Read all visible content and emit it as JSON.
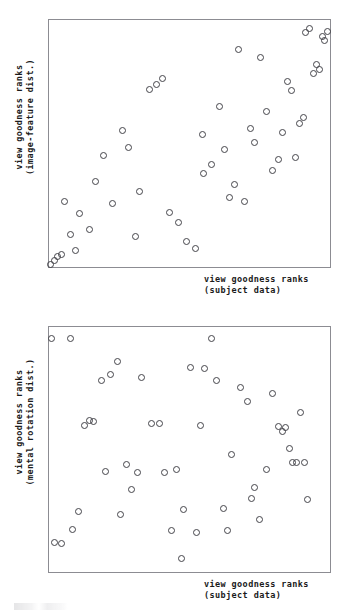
{
  "figure": {
    "background_color": "#ffffff",
    "frame_color": "#8c8c92",
    "marker_color": "#44444a",
    "text_color": "#1b1b1b"
  },
  "panels": [
    {
      "id": "top",
      "xlabel_line1": "view goodness ranks",
      "xlabel_line2": "(subject data)",
      "ylabel_line1": "view goodness ranks",
      "ylabel_line2": "(image-feature dist.)"
    },
    {
      "id": "bottom",
      "xlabel_line1": "view goodness ranks",
      "xlabel_line2": "(subject data)",
      "ylabel_line1": "view goodness ranks",
      "ylabel_line2": "(mental rotation dist.)"
    }
  ],
  "chart_data": [
    {
      "type": "scatter",
      "title": "",
      "xlabel": "view goodness ranks (subject data)",
      "ylabel": "view goodness ranks (image-feature dist.)",
      "xlim": [
        0,
        100
      ],
      "ylim": [
        0,
        100
      ],
      "grid": false,
      "legend": "none",
      "marker": "open-circle",
      "n_points": 52,
      "points": [
        [
          0.7,
          1.2
        ],
        [
          2.1,
          2.6
        ],
        [
          3.2,
          4.1
        ],
        [
          4.6,
          5.0
        ],
        [
          7.5,
          13.0
        ],
        [
          9.3,
          6.8
        ],
        [
          5.6,
          26.5
        ],
        [
          10.9,
          21.5
        ],
        [
          14.3,
          15.0
        ],
        [
          16.7,
          34.5
        ],
        [
          19.3,
          45.0
        ],
        [
          22.6,
          25.8
        ],
        [
          26.0,
          55.3
        ],
        [
          28.2,
          48.2
        ],
        [
          30.9,
          12.5
        ],
        [
          32.2,
          30.5
        ],
        [
          35.6,
          72.0
        ],
        [
          38.1,
          74.0
        ],
        [
          40.5,
          76.5
        ],
        [
          43.0,
          22.0
        ],
        [
          46.2,
          18.0
        ],
        [
          49.0,
          10.5
        ],
        [
          52.0,
          7.5
        ],
        [
          54.5,
          53.5
        ],
        [
          55.0,
          38.0
        ],
        [
          57.9,
          41.5
        ],
        [
          60.5,
          65.0
        ],
        [
          62.4,
          47.5
        ],
        [
          64.1,
          28.0
        ],
        [
          66.0,
          33.5
        ],
        [
          67.5,
          88.0
        ],
        [
          69.4,
          26.5
        ],
        [
          71.8,
          56.0
        ],
        [
          73.0,
          50.3
        ],
        [
          75.1,
          85.0
        ],
        [
          77.3,
          62.8
        ],
        [
          79.5,
          39.0
        ],
        [
          81.6,
          43.5
        ],
        [
          83.1,
          54.5
        ],
        [
          84.9,
          75.0
        ],
        [
          86.2,
          71.5
        ],
        [
          87.8,
          44.5
        ],
        [
          89.0,
          58.0
        ],
        [
          90.5,
          60.5
        ],
        [
          91.2,
          95.0
        ],
        [
          92.6,
          96.5
        ],
        [
          94.0,
          78.5
        ],
        [
          95.1,
          82.0
        ],
        [
          96.3,
          80.0
        ],
        [
          97.2,
          93.5
        ],
        [
          98.1,
          91.5
        ],
        [
          99.2,
          95.5
        ]
      ]
    },
    {
      "type": "scatter",
      "title": "",
      "xlabel": "view goodness ranks (subject data)",
      "ylabel": "view goodness ranks (mental rotation dist.)",
      "xlim": [
        0,
        100
      ],
      "ylim": [
        0,
        100
      ],
      "grid": false,
      "legend": "none",
      "marker": "open-circle",
      "n_points": 50,
      "points": [
        [
          0.8,
          95.5
        ],
        [
          7.6,
          95.5
        ],
        [
          1.9,
          12.0
        ],
        [
          4.5,
          11.5
        ],
        [
          10.5,
          24.5
        ],
        [
          16.0,
          61.5
        ],
        [
          18.6,
          78.0
        ],
        [
          22.0,
          80.5
        ],
        [
          24.2,
          86.0
        ],
        [
          25.5,
          23.5
        ],
        [
          27.5,
          44.0
        ],
        [
          29.4,
          33.5
        ],
        [
          33.0,
          79.5
        ],
        [
          36.5,
          60.5
        ],
        [
          39.4,
          60.5
        ],
        [
          43.5,
          17.0
        ],
        [
          45.5,
          42.0
        ],
        [
          48.0,
          25.5
        ],
        [
          50.5,
          83.5
        ],
        [
          54.0,
          60.0
        ],
        [
          55.5,
          83.0
        ],
        [
          57.7,
          95.5
        ],
        [
          59.5,
          78.0
        ],
        [
          62.0,
          26.0
        ],
        [
          65.0,
          48.0
        ],
        [
          68.0,
          75.5
        ],
        [
          70.5,
          69.5
        ],
        [
          73.0,
          34.5
        ],
        [
          75.0,
          21.5
        ],
        [
          77.5,
          42.0
        ],
        [
          79.5,
          73.0
        ],
        [
          81.5,
          59.5
        ],
        [
          83.0,
          57.5
        ],
        [
          84.2,
          59.0
        ],
        [
          85.5,
          50.5
        ],
        [
          86.5,
          44.5
        ],
        [
          88.0,
          44.5
        ],
        [
          89.5,
          65.0
        ],
        [
          91.0,
          44.5
        ],
        [
          92.0,
          29.5
        ],
        [
          12.5,
          60.0
        ],
        [
          14.5,
          62.0
        ],
        [
          20.0,
          41.0
        ],
        [
          31.5,
          40.5
        ],
        [
          41.0,
          40.5
        ],
        [
          52.5,
          16.0
        ],
        [
          63.5,
          17.0
        ],
        [
          72.0,
          30.0
        ],
        [
          47.0,
          5.5
        ],
        [
          8.5,
          17.5
        ]
      ]
    }
  ]
}
